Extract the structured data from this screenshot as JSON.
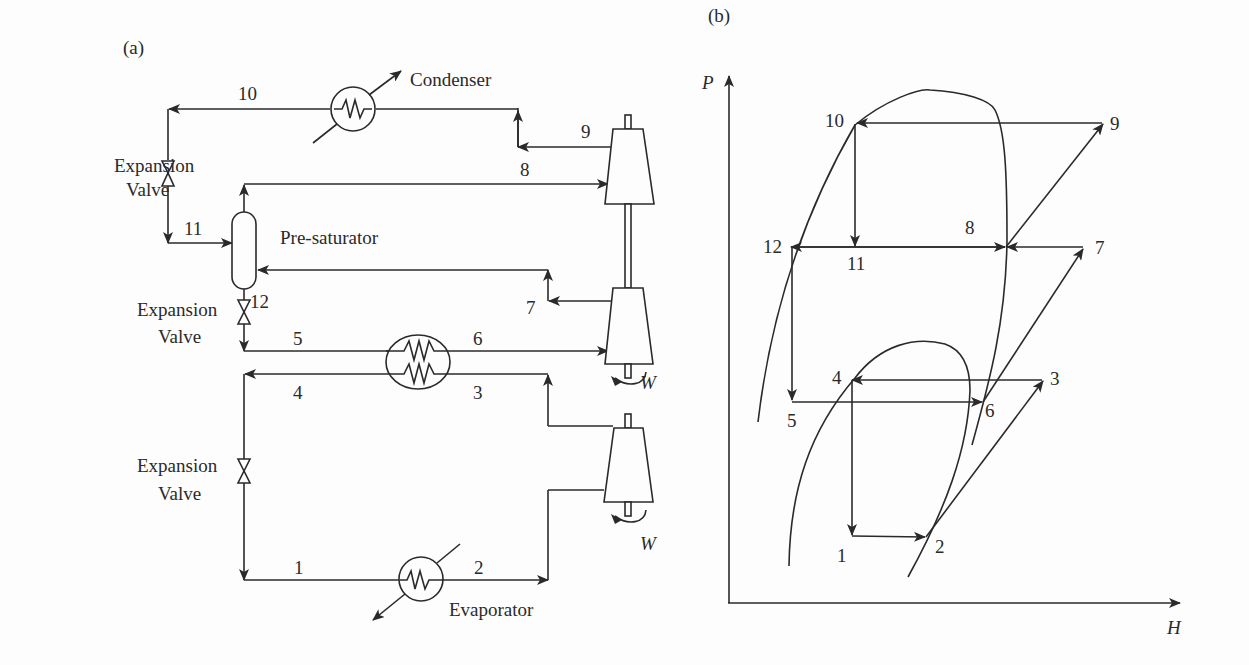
{
  "panel_a": {
    "label": "(a)",
    "components": {
      "condenser": "Condenser",
      "evaporator": "Evaporator",
      "presaturator": "Pre-saturator",
      "valve_line1": "Expansion",
      "valve_line2": "Valve",
      "work": "W"
    },
    "states": {
      "s1": "1",
      "s2": "2",
      "s3": "3",
      "s4": "4",
      "s5": "5",
      "s6": "6",
      "s7": "7",
      "s8": "8",
      "s9": "9",
      "s10": "10",
      "s11": "11",
      "s12": "12"
    }
  },
  "panel_b": {
    "label": "(b)",
    "y_axis": "P",
    "x_axis": "H",
    "states": {
      "s1": "1",
      "s2": "2",
      "s3": "3",
      "s4": "4",
      "s5": "5",
      "s6": "6",
      "s7": "7",
      "s8": "8",
      "s9": "9",
      "s10": "10",
      "s11": "11",
      "s12": "12"
    }
  }
}
